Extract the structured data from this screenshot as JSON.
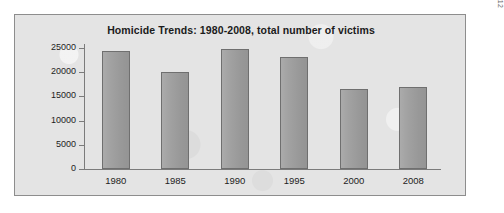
{
  "figure": {
    "source_credit": "Source: U.S. Census, Statistical Abstract of the United States, 2012"
  },
  "colors": {
    "panel_background": "#e4e4e4",
    "panel_border": "#8d8d8d",
    "bar_fill": "#9d9d9d",
    "bar_border": "#6f6f6f",
    "axis": "#7b7b7b",
    "text": "#1d1d1d",
    "page_background": "#ffffff"
  },
  "chart_data": {
    "type": "bar",
    "title": "Homicide Trends: 1980-2008, total number of victims",
    "xlabel": "",
    "ylabel": "",
    "categories": [
      "1980",
      "1985",
      "1990",
      "1995",
      "2000",
      "2008"
    ],
    "values": [
      24400,
      20000,
      24700,
      23200,
      16500,
      17000
    ],
    "ylim": [
      0,
      25000
    ],
    "yticks": [
      0,
      5000,
      10000,
      15000,
      20000,
      25000
    ],
    "ytick_labels": [
      "0",
      "5000",
      "10000",
      "15000",
      "20000",
      "25000"
    ],
    "grid": false,
    "legend": null,
    "series": [
      {
        "name": "total number of victims",
        "values": [
          24400,
          20000,
          24700,
          23200,
          16500,
          17000
        ]
      }
    ]
  }
}
